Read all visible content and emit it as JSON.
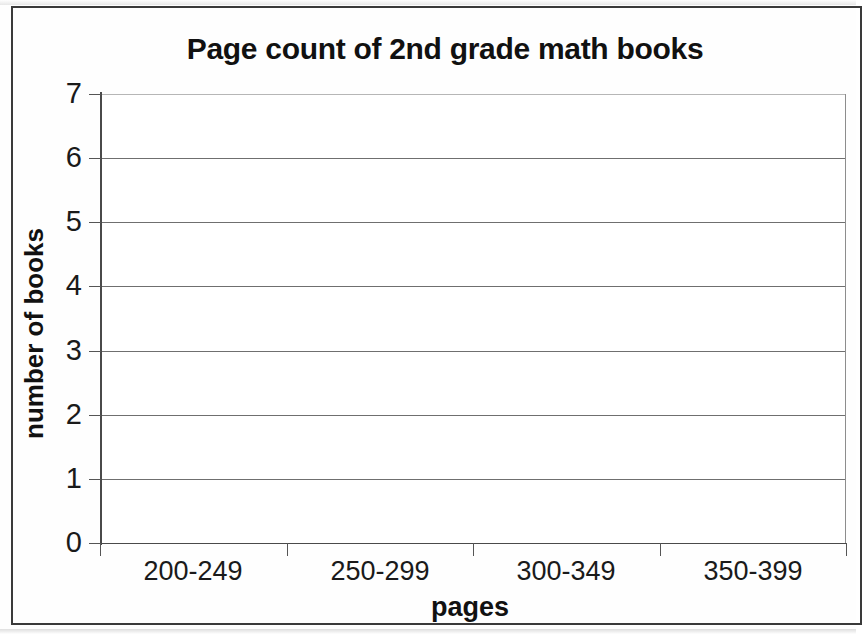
{
  "chart_data": {
    "type": "bar",
    "title": "Page count of 2nd grade math books",
    "xlabel": "pages",
    "ylabel": "number of books",
    "categories": [
      "200-249",
      "250-299",
      "300-349",
      "350-399"
    ],
    "values": [
      null,
      null,
      null,
      null
    ],
    "series": [
      {
        "name": "number of books",
        "values": [
          null,
          null,
          null,
          null
        ]
      }
    ],
    "ylim": [
      0,
      7
    ],
    "ytick_labels": [
      "0",
      "1",
      "2",
      "3",
      "4",
      "5",
      "6",
      "7"
    ],
    "ytick_values": [
      0,
      1,
      2,
      3,
      4,
      5,
      6,
      7
    ],
    "ytick_step": 1,
    "grid": "horizontal",
    "legend": "none",
    "colors": {
      "background": "#ffffff",
      "gridline": "#6f6f6f",
      "axis": "#4a4a4a",
      "text": "#1a1a1a",
      "border": "#3a3a3a"
    }
  }
}
